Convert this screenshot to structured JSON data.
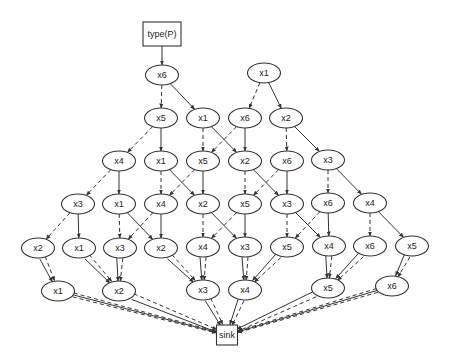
{
  "diagram": {
    "type": "directed-acyclic-graph",
    "width": 451,
    "height": 364,
    "colors": {
      "stroke": "#333333",
      "fill": "#ffffff",
      "text": "#222222",
      "background": "#ffffff"
    },
    "source": {
      "id": "src",
      "label": "type(P)",
      "shape": "box",
      "x": 162,
      "y": 34,
      "w": 38,
      "h": 24
    },
    "sink": {
      "id": "sink",
      "label": "sink",
      "shape": "box",
      "x": 227,
      "y": 335,
      "w": 21,
      "h": 20
    },
    "nodes": [
      {
        "id": "r1a",
        "label": "x6",
        "x": 162,
        "y": 75
      },
      {
        "id": "r1b",
        "label": "x1",
        "x": 264,
        "y": 73
      },
      {
        "id": "r2a",
        "label": "x5",
        "x": 161,
        "y": 118
      },
      {
        "id": "r2b",
        "label": "x1",
        "x": 203,
        "y": 118
      },
      {
        "id": "r2c",
        "label": "x6",
        "x": 245,
        "y": 118
      },
      {
        "id": "r2d",
        "label": "x2",
        "x": 286,
        "y": 118
      },
      {
        "id": "r3a",
        "label": "x4",
        "x": 119,
        "y": 161
      },
      {
        "id": "r3b",
        "label": "x1",
        "x": 161,
        "y": 161
      },
      {
        "id": "r3c",
        "label": "x5",
        "x": 203,
        "y": 161
      },
      {
        "id": "r3d",
        "label": "x2",
        "x": 245,
        "y": 161
      },
      {
        "id": "r3e",
        "label": "x6",
        "x": 287,
        "y": 161
      },
      {
        "id": "r3f",
        "label": "x3",
        "x": 328,
        "y": 160
      },
      {
        "id": "r4a",
        "label": "x3",
        "x": 78,
        "y": 204
      },
      {
        "id": "r4b",
        "label": "x1",
        "x": 119,
        "y": 204
      },
      {
        "id": "r4c",
        "label": "x4",
        "x": 161,
        "y": 204
      },
      {
        "id": "r4d",
        "label": "x2",
        "x": 203,
        "y": 204
      },
      {
        "id": "r4e",
        "label": "x5",
        "x": 245,
        "y": 204
      },
      {
        "id": "r4f",
        "label": "x3",
        "x": 287,
        "y": 204
      },
      {
        "id": "r4g",
        "label": "x6",
        "x": 328,
        "y": 203
      },
      {
        "id": "r4h",
        "label": "x4",
        "x": 370,
        "y": 203
      },
      {
        "id": "r5a",
        "label": "x2",
        "x": 38,
        "y": 248
      },
      {
        "id": "r5b",
        "label": "x1",
        "x": 79,
        "y": 248
      },
      {
        "id": "r5c",
        "label": "x3",
        "x": 120,
        "y": 248
      },
      {
        "id": "r5d",
        "label": "x2",
        "x": 161,
        "y": 248
      },
      {
        "id": "r5e",
        "label": "x4",
        "x": 203,
        "y": 247
      },
      {
        "id": "r5f",
        "label": "x3",
        "x": 245,
        "y": 247
      },
      {
        "id": "r5g",
        "label": "x5",
        "x": 287,
        "y": 247
      },
      {
        "id": "r5h",
        "label": "x4",
        "x": 329,
        "y": 246
      },
      {
        "id": "r5i",
        "label": "x6",
        "x": 370,
        "y": 246
      },
      {
        "id": "r5j",
        "label": "x5",
        "x": 412,
        "y": 246
      },
      {
        "id": "r6a",
        "label": "x1",
        "x": 58,
        "y": 291
      },
      {
        "id": "r6b",
        "label": "x2",
        "x": 119,
        "y": 291
      },
      {
        "id": "r6c",
        "label": "x3",
        "x": 203,
        "y": 290
      },
      {
        "id": "r6d",
        "label": "x4",
        "x": 245,
        "y": 290
      },
      {
        "id": "r6e",
        "label": "x5",
        "x": 328,
        "y": 288
      },
      {
        "id": "r6f",
        "label": "x6",
        "x": 392,
        "y": 286
      }
    ],
    "edges": [
      {
        "from": "src",
        "to": "r1a",
        "style": "solid"
      },
      {
        "from": "r1a",
        "to": "r2a",
        "style": "dashed"
      },
      {
        "from": "r1a",
        "to": "r2b",
        "style": "solid"
      },
      {
        "from": "r1b",
        "to": "r2c",
        "style": "dashed"
      },
      {
        "from": "r1b",
        "to": "r2d",
        "style": "solid"
      },
      {
        "from": "r2a",
        "to": "r3a",
        "style": "dashed"
      },
      {
        "from": "r2a",
        "to": "r3b",
        "style": "solid"
      },
      {
        "from": "r2b",
        "to": "r3c",
        "style": "dashed"
      },
      {
        "from": "r2b",
        "to": "r3d",
        "style": "solid"
      },
      {
        "from": "r2c",
        "to": "r3c",
        "style": "dashed"
      },
      {
        "from": "r2c",
        "to": "r3d",
        "style": "solid"
      },
      {
        "from": "r2d",
        "to": "r3e",
        "style": "dashed"
      },
      {
        "from": "r2d",
        "to": "r3f",
        "style": "solid"
      },
      {
        "from": "r3a",
        "to": "r4a",
        "style": "dashed"
      },
      {
        "from": "r3a",
        "to": "r4b",
        "style": "solid"
      },
      {
        "from": "r3b",
        "to": "r4c",
        "style": "dashed"
      },
      {
        "from": "r3b",
        "to": "r4d",
        "style": "solid"
      },
      {
        "from": "r3c",
        "to": "r4c",
        "style": "dashed"
      },
      {
        "from": "r3c",
        "to": "r4d",
        "style": "solid"
      },
      {
        "from": "r3d",
        "to": "r4e",
        "style": "dashed"
      },
      {
        "from": "r3d",
        "to": "r4f",
        "style": "solid"
      },
      {
        "from": "r3e",
        "to": "r4e",
        "style": "dashed"
      },
      {
        "from": "r3e",
        "to": "r4f",
        "style": "solid"
      },
      {
        "from": "r3f",
        "to": "r4g",
        "style": "dashed"
      },
      {
        "from": "r3f",
        "to": "r4h",
        "style": "solid"
      },
      {
        "from": "r4a",
        "to": "r5a",
        "style": "dashed"
      },
      {
        "from": "r4a",
        "to": "r5b",
        "style": "solid"
      },
      {
        "from": "r4b",
        "to": "r5c",
        "style": "dashed"
      },
      {
        "from": "r4b",
        "to": "r5d",
        "style": "solid"
      },
      {
        "from": "r4c",
        "to": "r5c",
        "style": "dashed"
      },
      {
        "from": "r4c",
        "to": "r5d",
        "style": "solid"
      },
      {
        "from": "r4d",
        "to": "r5e",
        "style": "dashed"
      },
      {
        "from": "r4d",
        "to": "r5f",
        "style": "solid"
      },
      {
        "from": "r4e",
        "to": "r5e",
        "style": "dashed"
      },
      {
        "from": "r4e",
        "to": "r5f",
        "style": "solid"
      },
      {
        "from": "r4f",
        "to": "r5g",
        "style": "dashed"
      },
      {
        "from": "r4f",
        "to": "r5h",
        "style": "solid"
      },
      {
        "from": "r4g",
        "to": "r5g",
        "style": "dashed"
      },
      {
        "from": "r4g",
        "to": "r5h",
        "style": "solid"
      },
      {
        "from": "r4h",
        "to": "r5i",
        "style": "dashed"
      },
      {
        "from": "r4h",
        "to": "r5j",
        "style": "solid"
      },
      {
        "from": "r5a",
        "to": "r6a",
        "style": "dashed",
        "offset": -3
      },
      {
        "from": "r5a",
        "to": "r6a",
        "style": "solid",
        "offset": 3
      },
      {
        "from": "r5b",
        "to": "r6b",
        "style": "dashed",
        "offset": -3
      },
      {
        "from": "r5b",
        "to": "r6b",
        "style": "solid",
        "offset": 3
      },
      {
        "from": "r5c",
        "to": "r6b",
        "style": "dashed",
        "offset": -3
      },
      {
        "from": "r5c",
        "to": "r6b",
        "style": "solid",
        "offset": 3
      },
      {
        "from": "r5d",
        "to": "r6c",
        "style": "dashed",
        "offset": -3
      },
      {
        "from": "r5d",
        "to": "r6c",
        "style": "solid",
        "offset": 3
      },
      {
        "from": "r5e",
        "to": "r6c",
        "style": "dashed",
        "offset": -3
      },
      {
        "from": "r5e",
        "to": "r6c",
        "style": "solid",
        "offset": 3
      },
      {
        "from": "r5f",
        "to": "r6d",
        "style": "dashed",
        "offset": -3
      },
      {
        "from": "r5f",
        "to": "r6d",
        "style": "solid",
        "offset": 3
      },
      {
        "from": "r5g",
        "to": "r6d",
        "style": "dashed",
        "offset": -3
      },
      {
        "from": "r5g",
        "to": "r6d",
        "style": "solid",
        "offset": 3
      },
      {
        "from": "r5h",
        "to": "r6e",
        "style": "dashed",
        "offset": -3
      },
      {
        "from": "r5h",
        "to": "r6e",
        "style": "solid",
        "offset": 3
      },
      {
        "from": "r5i",
        "to": "r6e",
        "style": "dashed",
        "offset": -3
      },
      {
        "from": "r5i",
        "to": "r6e",
        "style": "solid",
        "offset": 3
      },
      {
        "from": "r5j",
        "to": "r6f",
        "style": "dashed",
        "offset": -3
      },
      {
        "from": "r5j",
        "to": "r6f",
        "style": "solid",
        "offset": 3
      },
      {
        "from": "r6a",
        "to": "sink",
        "style": "dashed",
        "offset": -2
      },
      {
        "from": "r6a",
        "to": "sink",
        "style": "solid",
        "offset": 0
      },
      {
        "from": "r6a",
        "to": "sink",
        "style": "dashed",
        "offset": 2
      },
      {
        "from": "r6b",
        "to": "sink",
        "style": "dashed",
        "offset": -3
      },
      {
        "from": "r6b",
        "to": "sink",
        "style": "solid",
        "offset": 3
      },
      {
        "from": "r6c",
        "to": "sink",
        "style": "dashed",
        "offset": -3
      },
      {
        "from": "r6c",
        "to": "sink",
        "style": "solid",
        "offset": 3
      },
      {
        "from": "r6d",
        "to": "sink",
        "style": "dashed",
        "offset": -3
      },
      {
        "from": "r6d",
        "to": "sink",
        "style": "solid",
        "offset": 3
      },
      {
        "from": "r6e",
        "to": "sink",
        "style": "dashed",
        "offset": -3
      },
      {
        "from": "r6e",
        "to": "sink",
        "style": "solid",
        "offset": 3
      },
      {
        "from": "r6f",
        "to": "sink",
        "style": "dashed",
        "offset": -2
      },
      {
        "from": "r6f",
        "to": "sink",
        "style": "solid",
        "offset": 0
      },
      {
        "from": "r6f",
        "to": "sink",
        "style": "dashed",
        "offset": 2
      }
    ]
  }
}
